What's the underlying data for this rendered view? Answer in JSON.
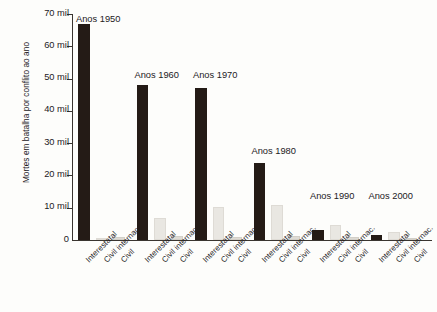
{
  "chart_data": {
    "type": "bar",
    "title": "",
    "xlabel": "",
    "ylabel": "Mortes em batalha por conflito ao ano",
    "ylim": [
      0,
      70000
    ],
    "y_unit": "mil",
    "grid": false,
    "legend_position": "none",
    "y_ticks": [
      {
        "value": 70000,
        "label": "70 mil"
      },
      {
        "value": 60000,
        "label": "60 mil"
      },
      {
        "value": 50000,
        "label": "50 mil"
      },
      {
        "value": 40000,
        "label": "40 mil"
      },
      {
        "value": 30000,
        "label": "30 mil"
      },
      {
        "value": 20000,
        "label": "20 mil"
      },
      {
        "value": 10000,
        "label": "10 mil"
      },
      {
        "value": 0,
        "label": "0"
      }
    ],
    "categories": [
      "Anos 1950",
      "Anos 1960",
      "Anos 1970",
      "Anos 1980",
      "Anos 1990",
      "Anos 2000"
    ],
    "subcategories": [
      "Interestatal",
      "Civil internac.",
      "Civil"
    ],
    "series": [
      {
        "name": "Interestatal",
        "color": "#241b16",
        "values": [
          67000,
          48000,
          47000,
          24000,
          3200,
          1600
        ]
      },
      {
        "name": "Civil internac.",
        "color": "#e9e7e2",
        "values": [
          300,
          6700,
          10200,
          10800,
          4800,
          2500
        ]
      },
      {
        "name": "Civil",
        "color": "#dedbd4",
        "values": [
          900,
          1300,
          1000,
          1300,
          900,
          500
        ]
      }
    ],
    "groups": [
      {
        "label": "Anos 1950",
        "bars": [
          {
            "category": "Interestatal",
            "value": 67000
          },
          {
            "category": "Civil internac.",
            "value": 300
          },
          {
            "category": "Civil",
            "value": 900
          }
        ]
      },
      {
        "label": "Anos 1960",
        "bars": [
          {
            "category": "Interestatal",
            "value": 48000
          },
          {
            "category": "Civil internac.",
            "value": 6700
          },
          {
            "category": "Civil",
            "value": 1300
          }
        ]
      },
      {
        "label": "Anos 1970",
        "bars": [
          {
            "category": "Interestatal",
            "value": 47000
          },
          {
            "category": "Civil internac.",
            "value": 10200
          },
          {
            "category": "Civil",
            "value": 1000
          }
        ]
      },
      {
        "label": "Anos 1980",
        "bars": [
          {
            "category": "Interestatal",
            "value": 24000
          },
          {
            "category": "Civil internac.",
            "value": 10800
          },
          {
            "category": "Civil",
            "value": 1300
          }
        ]
      },
      {
        "label": "Anos 1990",
        "bars": [
          {
            "category": "Interestatal",
            "value": 3200
          },
          {
            "category": "Civil internac.",
            "value": 4800
          },
          {
            "category": "Civil",
            "value": 900
          }
        ]
      },
      {
        "label": "Anos 2000",
        "bars": [
          {
            "category": "Interestatal",
            "value": 1600
          },
          {
            "category": "Civil internac.",
            "value": 2500
          },
          {
            "category": "Civil",
            "value": 500
          }
        ]
      }
    ]
  },
  "colors": {
    "background": "#fdfdfb",
    "axis": "#3a3530",
    "text": "#23201d",
    "bar_dark": "#241b16",
    "bar_light": "#e9e7e2",
    "bar_light_alt": "#dedbd4"
  }
}
